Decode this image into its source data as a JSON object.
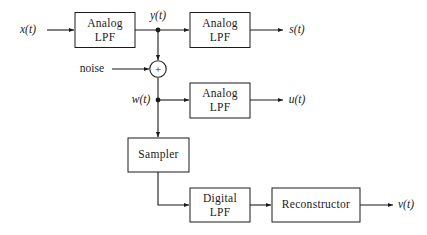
{
  "diagram": {
    "background_color": "#ffffff",
    "line_color": "#1a1a1a",
    "blocks": [
      {
        "id": "analog_lpf_1",
        "label_line1": "Analog",
        "label_line2": "LPF"
      },
      {
        "id": "analog_lpf_2",
        "label_line1": "Analog",
        "label_line2": "LPF"
      },
      {
        "id": "analog_lpf_3",
        "label_line1": "Analog",
        "label_line2": "LPF"
      },
      {
        "id": "sampler",
        "label_line1": "Sampler",
        "label_line2": ""
      },
      {
        "id": "digital_lpf",
        "label_line1": "Digital",
        "label_line2": "LPF"
      },
      {
        "id": "reconstructor",
        "label_line1": "Reconstructor",
        "label_line2": ""
      }
    ],
    "signals": {
      "input": "x(t)",
      "after_lpf1": "y(t)",
      "noise": "noise",
      "after_sum": "w(t)",
      "output_top": "s(t)",
      "output_mid": "u(t)",
      "output_bottom": "v(t)"
    },
    "summing_junction": {
      "sign": "+",
      "operation": "add"
    }
  }
}
